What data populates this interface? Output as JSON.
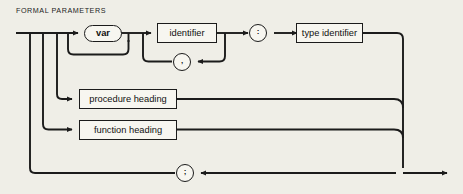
{
  "diagram": {
    "title": "FORMAL PARAMETERS",
    "type": "railroad-syntax-diagram",
    "background_color": "#efeee7",
    "line_color": "#1b1b1b",
    "node_fill": "#f7f6f0",
    "nodes": {
      "var_keyword": "var",
      "identifier": "identifier",
      "comma": ",",
      "colon": ":",
      "type_identifier": "type identifier",
      "procedure_heading": "procedure heading",
      "function_heading": "function heading",
      "semicolon": ";"
    }
  }
}
